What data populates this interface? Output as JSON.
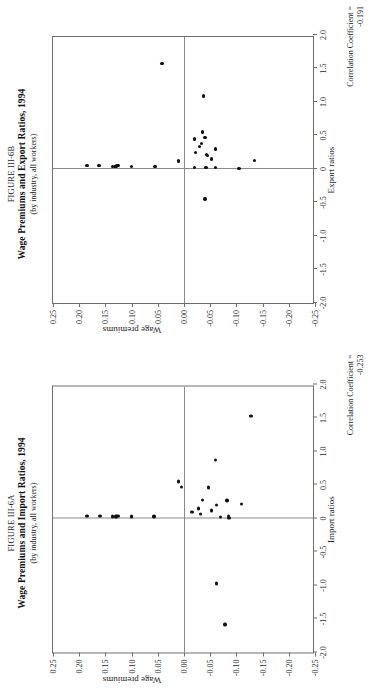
{
  "page": {
    "background": "#ffffff",
    "point_color": "#111111",
    "axis_color": "#6e6e6e"
  },
  "figures": [
    {
      "id": "figure-iii-6b",
      "number": "FIGURE III-6B",
      "title": "Wage Premiums and Export Ratios, 1994",
      "subtitle": "(by industry, all workers)",
      "correlation_label": "Correlation Coefficient =",
      "correlation_value": "-0.191",
      "chart_data": {
        "type": "scatter",
        "title": "Wage Premiums and Export Ratios, 1994",
        "subtitle": "(by industry, all workers)",
        "xlabel": "Export ratios",
        "ylabel": "Wage premiums",
        "xlim": [
          -2.0,
          2.0
        ],
        "ylim": [
          -0.25,
          0.25
        ],
        "xticks": [
          -2.0,
          -1.5,
          -1.0,
          -0.5,
          0,
          0.5,
          1.0,
          1.5,
          2.0
        ],
        "xticklabels": [
          "-2.0",
          "-1.5",
          "-1.0",
          "-0.5",
          "0",
          "0.5",
          "1.0",
          "1.5",
          "2.0"
        ],
        "yticks": [
          -0.25,
          -0.2,
          -0.15,
          -0.1,
          -0.05,
          0.0,
          0.05,
          0.1,
          0.15,
          0.2,
          0.25
        ],
        "yticklabels": [
          "-0.25",
          "-0.20",
          "-0.15",
          "-0.10",
          "-0.05",
          "0.00",
          "0.05",
          "0.10",
          "0.15",
          "0.20",
          "0.25"
        ],
        "grid": false,
        "legend": false,
        "annotation": "Correlation Coefficient = -0.191",
        "correlation": -0.191,
        "points": [
          {
            "x": 0.05,
            "y": 0.185
          },
          {
            "x": 0.05,
            "y": 0.162
          },
          {
            "x": 0.04,
            "y": 0.137
          },
          {
            "x": 0.04,
            "y": 0.132
          },
          {
            "x": 0.04,
            "y": 0.13
          },
          {
            "x": 0.05,
            "y": 0.128
          },
          {
            "x": 0.05,
            "y": 0.126
          },
          {
            "x": 0.04,
            "y": 0.1
          },
          {
            "x": 0.04,
            "y": 0.055
          },
          {
            "x": 1.57,
            "y": 0.042
          },
          {
            "x": 0.12,
            "y": 0.01
          },
          {
            "x": 0.45,
            "y": -0.02
          },
          {
            "x": 0.25,
            "y": -0.022
          },
          {
            "x": 1.09,
            "y": -0.037
          },
          {
            "x": 0.34,
            "y": -0.03
          },
          {
            "x": 0.38,
            "y": -0.033
          },
          {
            "x": 0.55,
            "y": -0.035
          },
          {
            "x": 0.47,
            "y": -0.04
          },
          {
            "x": 0.22,
            "y": -0.043
          },
          {
            "x": 0.3,
            "y": -0.06
          },
          {
            "x": 0.15,
            "y": -0.052
          },
          {
            "x": 0.02,
            "y": -0.02
          },
          {
            "x": 0.02,
            "y": -0.042
          },
          {
            "x": 0.2,
            "y": -0.045
          },
          {
            "x": 0.02,
            "y": -0.06
          },
          {
            "x": 0.01,
            "y": -0.105
          },
          {
            "x": -0.45,
            "y": -0.04
          },
          {
            "x": 0.13,
            "y": -0.135
          }
        ]
      }
    },
    {
      "id": "figure-iii-6a",
      "number": "FIGURE III-6A",
      "title": "Wage Premiums and Import Ratios, 1994",
      "subtitle": "(by industry, all workers)",
      "correlation_label": "Correlation Coefficient =",
      "correlation_value": "-0.253",
      "chart_data": {
        "type": "scatter",
        "title": "Wage Premiums and Import Ratios, 1994",
        "subtitle": "(by industry, all workers)",
        "xlabel": "Import ratios",
        "ylabel": "Wage premiums",
        "xlim": [
          -2.0,
          2.0
        ],
        "ylim": [
          -0.25,
          0.25
        ],
        "xticks": [
          -2.0,
          -1.5,
          -1.0,
          -0.5,
          0,
          0.5,
          1.0,
          1.5,
          2.0
        ],
        "xticklabels": [
          "-2.0",
          "-1.5",
          "-1.0",
          "-0.5",
          "0",
          "0.5",
          "1.0",
          "1.5",
          "2.0"
        ],
        "yticks": [
          -0.25,
          -0.2,
          -0.15,
          -0.1,
          -0.05,
          0.0,
          0.05,
          0.1,
          0.15,
          0.2,
          0.25
        ],
        "yticklabels": [
          "-0.25",
          "-0.20",
          "-0.15",
          "-0.10",
          "-0.05",
          "0.00",
          "0.05",
          "0.10",
          "0.15",
          "0.20",
          "0.25"
        ],
        "grid": false,
        "legend": false,
        "annotation": "Correlation Coefficient = -0.253",
        "correlation": -0.253,
        "points": [
          {
            "x": 0.04,
            "y": 0.185
          },
          {
            "x": 0.04,
            "y": 0.16
          },
          {
            "x": 0.03,
            "y": 0.137
          },
          {
            "x": 0.03,
            "y": 0.131
          },
          {
            "x": 0.03,
            "y": 0.129
          },
          {
            "x": 0.04,
            "y": 0.127
          },
          {
            "x": 0.04,
            "y": 0.125
          },
          {
            "x": 0.03,
            "y": 0.1
          },
          {
            "x": 0.03,
            "y": 0.057
          },
          {
            "x": 1.53,
            "y": -0.128
          },
          {
            "x": 0.63,
            "y": -0.25
          },
          {
            "x": 0.87,
            "y": -0.06
          },
          {
            "x": 0.55,
            "y": 0.01
          },
          {
            "x": 0.47,
            "y": 0.005
          },
          {
            "x": 0.46,
            "y": -0.047
          },
          {
            "x": 0.28,
            "y": -0.035
          },
          {
            "x": 0.1,
            "y": -0.015
          },
          {
            "x": 0.15,
            "y": -0.028
          },
          {
            "x": 0.07,
            "y": -0.031
          },
          {
            "x": 0.12,
            "y": -0.052
          },
          {
            "x": 0.2,
            "y": -0.062
          },
          {
            "x": 0.27,
            "y": -0.082
          },
          {
            "x": 0.22,
            "y": -0.11
          },
          {
            "x": 0.02,
            "y": -0.07
          },
          {
            "x": 0.01,
            "y": -0.086
          },
          {
            "x": 0.04,
            "y": -0.085
          },
          {
            "x": -0.97,
            "y": -0.062
          },
          {
            "x": -1.58,
            "y": -0.078
          }
        ]
      }
    }
  ]
}
